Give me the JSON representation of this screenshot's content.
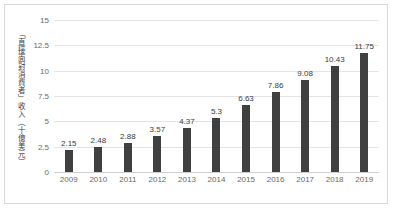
{
  "chart_data": {
    "type": "bar",
    "title": "",
    "subtitle": "",
    "xlabel": "",
    "ylabel": "「直接面對消費者」收入（十億美元）",
    "categories": [
      "2009",
      "2010",
      "2011",
      "2012",
      "2013",
      "2014",
      "2015",
      "2016",
      "2017",
      "2018",
      "2019"
    ],
    "values": [
      2.15,
      2.48,
      2.88,
      3.57,
      4.37,
      5.3,
      6.63,
      7.86,
      9.08,
      10.43,
      11.75
    ],
    "value_labels": [
      "2.15",
      "2.48",
      "2.88",
      "3.57",
      "4.37",
      "5.3",
      "6.63",
      "7.86",
      "9.08",
      "10.43",
      "11.75"
    ],
    "ylim": [
      0,
      15
    ],
    "yticks": [
      0,
      2.5,
      5,
      7.5,
      10,
      12.5,
      15
    ],
    "ytick_labels": [
      "0",
      "2.5",
      "5",
      "7.5",
      "10",
      "12.5",
      "15"
    ],
    "grid": true,
    "legend": false,
    "legend_position": "none",
    "bar_color": "#404040",
    "gridline_color": "#e4e4e4",
    "axis_text_color": "#6a6a6a",
    "border_color": "#d9d9d9",
    "background_color": "#ffffff"
  }
}
